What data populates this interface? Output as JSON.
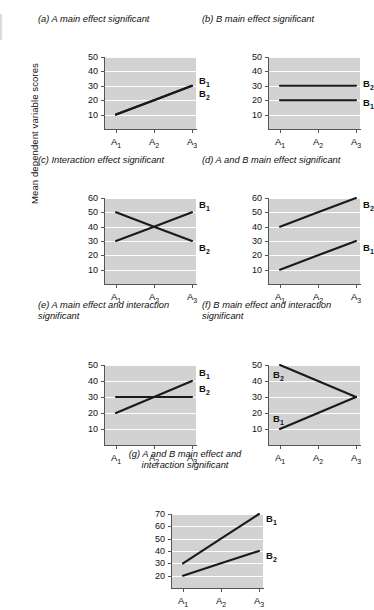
{
  "figure": {
    "y_axis_label": "Mean dependent variable scores",
    "x_categories": [
      "A₁",
      "A₂",
      "A₃"
    ]
  },
  "chart_data": [
    {
      "id": "a",
      "type": "line",
      "title": "(a) A main effect significant",
      "xlabel": "",
      "ylabel": "Mean dependent variable scores",
      "categories": [
        "A₁",
        "A₂",
        "A₃"
      ],
      "ylim": [
        0,
        50
      ],
      "yticks": [
        10,
        20,
        30,
        40,
        50
      ],
      "grid": true,
      "legend_position": "right-of-line-end",
      "series": [
        {
          "name": "B₁",
          "values": [
            10,
            20,
            30
          ],
          "label_value": 33
        },
        {
          "name": "B₂",
          "values": [
            10,
            20,
            30
          ],
          "label_value": 24
        }
      ],
      "annotation": "B₁ and B₂ overlap exactly; single rising line"
    },
    {
      "id": "b",
      "type": "line",
      "title": "(b) B main effect significant",
      "xlabel": "",
      "ylabel": "Mean dependent variable scores",
      "categories": [
        "A₁",
        "A₂",
        "A₃"
      ],
      "ylim": [
        0,
        50
      ],
      "yticks": [
        10,
        20,
        30,
        40,
        50
      ],
      "grid": true,
      "legend_position": "right-of-line-end",
      "series": [
        {
          "name": "B₂",
          "values": [
            30,
            30,
            30
          ],
          "label_value": 31
        },
        {
          "name": "B₁",
          "values": [
            20,
            20,
            20
          ],
          "label_value": 18
        }
      ]
    },
    {
      "id": "c",
      "type": "line",
      "title": "(c) Interaction effect significant",
      "xlabel": "",
      "ylabel": "Mean dependent variable scores",
      "categories": [
        "A₁",
        "A₂",
        "A₃"
      ],
      "ylim": [
        0,
        60
      ],
      "yticks": [
        10,
        20,
        30,
        40,
        50,
        60
      ],
      "grid": true,
      "legend_position": "right-of-line-end",
      "series": [
        {
          "name": "B₁",
          "values": [
            30,
            40,
            50
          ],
          "label_value": 55
        },
        {
          "name": "B₂",
          "values": [
            50,
            40,
            30
          ],
          "label_value": 25
        }
      ]
    },
    {
      "id": "d",
      "type": "line",
      "title": "(d) A and B main effect significant",
      "xlabel": "",
      "ylabel": "Mean dependent variable scores",
      "categories": [
        "A₁",
        "A₂",
        "A₃"
      ],
      "ylim": [
        0,
        60
      ],
      "yticks": [
        10,
        20,
        30,
        40,
        50,
        60
      ],
      "grid": true,
      "legend_position": "right-of-line-end",
      "series": [
        {
          "name": "B₂",
          "values": [
            40,
            50,
            60
          ],
          "label_value": 55
        },
        {
          "name": "B₁",
          "values": [
            10,
            20,
            30
          ],
          "label_value": 25
        }
      ]
    },
    {
      "id": "e",
      "type": "line",
      "title": "(e) A main effect and interaction\nsignificant",
      "xlabel": "",
      "ylabel": "Mean dependent variable scores",
      "categories": [
        "A₁",
        "A₂",
        "A₃"
      ],
      "ylim": [
        0,
        50
      ],
      "yticks": [
        10,
        20,
        30,
        40,
        50
      ],
      "grid": true,
      "legend_position": "right-of-line-end",
      "series": [
        {
          "name": "B₁",
          "values": [
            20,
            30,
            40
          ],
          "label_value": 45
        },
        {
          "name": "B₂",
          "values": [
            30,
            30,
            30
          ],
          "label_value": 35
        }
      ]
    },
    {
      "id": "f",
      "type": "line",
      "title": "(f) B main effect and interaction\nsignificant",
      "xlabel": "",
      "ylabel": "Mean dependent variable scores",
      "categories": [
        "A₁",
        "A₂",
        "A₃"
      ],
      "ylim": [
        0,
        50
      ],
      "yticks": [
        10,
        20,
        30,
        40,
        50
      ],
      "grid": true,
      "legend_position": "inside-left",
      "series": [
        {
          "name": "B₂",
          "values": [
            50,
            40,
            30
          ],
          "label_value": 44
        },
        {
          "name": "B₁",
          "values": [
            10,
            20,
            30
          ],
          "label_value": 16
        }
      ]
    },
    {
      "id": "g",
      "type": "line",
      "title": "(g) A and B main effect and\ninteraction significant",
      "xlabel": "",
      "ylabel": "Mean dependent variable scores",
      "categories": [
        "A₁",
        "A₂",
        "A₃"
      ],
      "ylim": [
        10,
        70
      ],
      "yticks": [
        20,
        30,
        40,
        50,
        60,
        70
      ],
      "grid": true,
      "legend_position": "right-of-line-end",
      "series": [
        {
          "name": "B₁",
          "values": [
            30,
            50,
            70
          ],
          "label_value": 66
        },
        {
          "name": "B₂",
          "values": [
            20,
            30,
            40
          ],
          "label_value": 36
        }
      ]
    }
  ],
  "style": {
    "plot_background": "#d2d2d2",
    "gridline_color": "#fdfdfd",
    "line_color": "#1a1a1a",
    "axis_color": "#555555",
    "text_color": "#111111"
  }
}
